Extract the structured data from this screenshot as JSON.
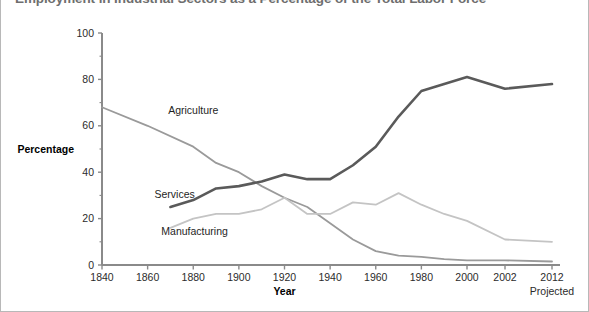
{
  "chart_data": {
    "type": "line",
    "title": "Employment in Industrial Sectors as a Percentage of the Total Labor Force",
    "xlabel": "Year",
    "ylabel": "Percentage",
    "grid": false,
    "legend_position": "inline-labels",
    "xlim": [
      1840,
      2012
    ],
    "ylim": [
      0,
      100
    ],
    "ytick_labels": [
      "0",
      "20",
      "40",
      "60",
      "80",
      "100"
    ],
    "ytick_values": [
      0,
      20,
      40,
      60,
      80,
      100
    ],
    "yminor_values": [
      10,
      30,
      50,
      70,
      90
    ],
    "xtick_labels": [
      "1840",
      "1860",
      "1880",
      "1900",
      "1920",
      "1940",
      "1960",
      "1980",
      "2000",
      "2002",
      "2012"
    ],
    "xtick_values": [
      1840,
      1860,
      1880,
      1900,
      1920,
      1940,
      1960,
      1980,
      2000,
      2002,
      2012
    ],
    "x_axis_note": "Projected",
    "series": [
      {
        "name": "Agriculture",
        "color": "#9a9a9a",
        "width": 1.8,
        "label_x": 1869,
        "label_y": 65,
        "x": [
          1840,
          1860,
          1880,
          1890,
          1900,
          1910,
          1920,
          1930,
          1940,
          1950,
          1960,
          1970,
          1980,
          1990,
          2000,
          2002,
          2012
        ],
        "values": [
          68,
          60,
          51,
          44,
          40,
          34,
          29,
          25,
          18,
          11,
          6,
          4,
          3.5,
          2.5,
          2,
          2,
          1.5
        ]
      },
      {
        "name": "Services",
        "color": "#5a5a5a",
        "width": 2.6,
        "label_x": 1863,
        "label_y": 29,
        "x": [
          1870,
          1880,
          1890,
          1900,
          1910,
          1920,
          1930,
          1940,
          1950,
          1960,
          1970,
          1980,
          1990,
          2000,
          2002,
          2012
        ],
        "values": [
          25,
          28,
          33,
          34,
          36,
          39,
          37,
          37,
          43,
          51,
          64,
          75,
          78,
          81,
          76,
          78
        ]
      },
      {
        "name": "Manufacturing",
        "color": "#c4c4c4",
        "width": 1.8,
        "label_x": 1866,
        "label_y": 13,
        "x": [
          1870,
          1880,
          1890,
          1900,
          1910,
          1920,
          1930,
          1940,
          1950,
          1960,
          1970,
          1980,
          1990,
          2000,
          2002,
          2012
        ],
        "values": [
          16,
          20,
          22,
          22,
          24,
          29,
          22,
          22,
          27,
          26,
          31,
          26,
          22,
          19,
          11,
          10
        ]
      }
    ]
  }
}
